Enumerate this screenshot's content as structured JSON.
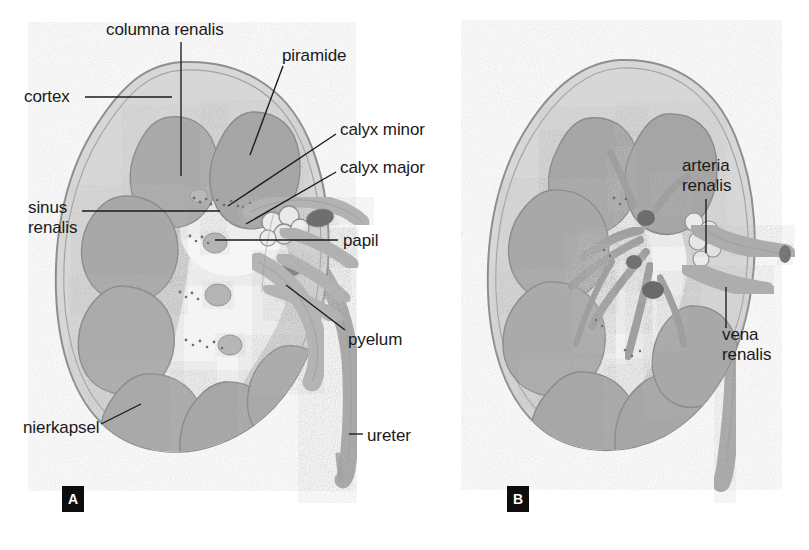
{
  "figure": {
    "background_color": "#ffffff",
    "line_color": "#1a1a1a",
    "panels": [
      {
        "id": "A",
        "badge": "A",
        "badge_x": 62,
        "badge_y": 486,
        "description": "Frontale doorsnede nier met schors, piramiden, kelken en pyelum"
      },
      {
        "id": "B",
        "badge": "B",
        "badge_x": 507,
        "badge_y": 486,
        "description": "Frontale doorsnede nier met vaatstelsel, arteria en vena renalis"
      }
    ],
    "palette": {
      "capsule_outline": "#8d8d8d",
      "cortex_fill": "#d5d5d5",
      "pyramid_fill": "#a9a9a9",
      "pyramid_outline": "#8a8a8a",
      "sinus_fill": "#f2f2f2",
      "calyx_fill": "#bdbdbd",
      "calyx_outline": "#8f8f8f",
      "vessel_fill": "#b0b0b0",
      "vessel_dark": "#7a7a7a",
      "ureter_fill": "#b8b8b8",
      "badge_bg": "#0d0d0d",
      "badge_text": "#ffffff"
    },
    "labels": [
      {
        "key": "columna_renalis",
        "text": "columna renalis",
        "x": 106,
        "y": 20,
        "align": "left",
        "panel": "A"
      },
      {
        "key": "piramide",
        "text": "piramide",
        "x": 282,
        "y": 46,
        "align": "left",
        "panel": "A"
      },
      {
        "key": "cortex",
        "text": "cortex",
        "x": 24,
        "y": 87,
        "align": "left",
        "panel": "A"
      },
      {
        "key": "calyx_minor",
        "text": "calyx minor",
        "x": 340,
        "y": 120,
        "align": "left",
        "panel": "A"
      },
      {
        "key": "calyx_major",
        "text": "calyx major",
        "x": 340,
        "y": 158,
        "align": "left",
        "panel": "A"
      },
      {
        "key": "sinus_renalis",
        "text": "sinus\nrenalis",
        "x": 28,
        "y": 198,
        "align": "left",
        "panel": "A"
      },
      {
        "key": "papil",
        "text": "papil",
        "x": 343,
        "y": 231,
        "align": "left",
        "panel": "A"
      },
      {
        "key": "pyelum",
        "text": "pyelum",
        "x": 348,
        "y": 330,
        "align": "left",
        "panel": "A"
      },
      {
        "key": "nierkapsel",
        "text": "nierkapsel",
        "x": 23,
        "y": 418,
        "align": "left",
        "panel": "A"
      },
      {
        "key": "ureter",
        "text": "ureter",
        "x": 367,
        "y": 426,
        "align": "left",
        "panel": "A"
      },
      {
        "key": "arteria_renalis",
        "text": "arteria\nrenalis",
        "x": 682,
        "y": 156,
        "align": "left",
        "panel": "B"
      },
      {
        "key": "vena_renalis",
        "text": "vena\nrenalis",
        "x": 722,
        "y": 325,
        "align": "left",
        "panel": "B"
      }
    ],
    "leader_lines": [
      {
        "key": "columna_renalis",
        "x1": 181,
        "y1": 42,
        "x2": 181,
        "y2": 176
      },
      {
        "key": "piramide",
        "x1": 283,
        "y1": 66,
        "x2": 250,
        "y2": 155
      },
      {
        "key": "cortex",
        "x1": 85,
        "y1": 97,
        "x2": 172,
        "y2": 97
      },
      {
        "key": "calyx_minor",
        "x1": 336,
        "y1": 134,
        "x2": 228,
        "y2": 206
      },
      {
        "key": "calyx_major",
        "x1": 336,
        "y1": 172,
        "x2": 246,
        "y2": 224
      },
      {
        "key": "sinus_renalis",
        "x1": 82,
        "y1": 211,
        "x2": 220,
        "y2": 211
      },
      {
        "key": "papil",
        "x1": 338,
        "y1": 240,
        "x2": 215,
        "y2": 240
      },
      {
        "key": "pyelum",
        "x1": 345,
        "y1": 330,
        "x2": 286,
        "y2": 285
      },
      {
        "key": "nierkapsel",
        "x1": 101,
        "y1": 424,
        "x2": 141,
        "y2": 404
      },
      {
        "key": "ureter",
        "x1": 363,
        "y1": 434,
        "x2": 349,
        "y2": 434
      },
      {
        "key": "arteria_renalis",
        "x1": 706,
        "y1": 199,
        "x2": 706,
        "y2": 253
      },
      {
        "key": "vena_renalis",
        "x1": 726,
        "y1": 287,
        "x2": 726,
        "y2": 328
      }
    ]
  }
}
